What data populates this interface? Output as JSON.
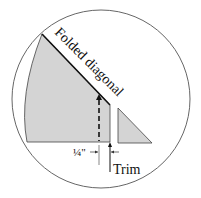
{
  "diagram": {
    "labels": {
      "folded_diagonal": "Folded diagonal",
      "quarter_inch": "¼\"",
      "trim": "Trim"
    },
    "colors": {
      "fill": "#d3d3d3",
      "stroke": "#222222",
      "circle": "#555555"
    }
  }
}
